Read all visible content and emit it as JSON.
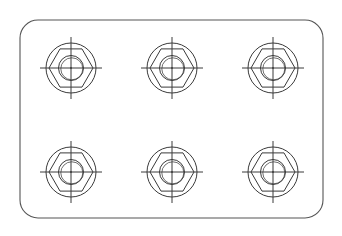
{
  "drawing": {
    "background": "#ffffff",
    "line_color": "#3a3a3a",
    "frame": {
      "x": 20,
      "y": 20,
      "width": 303,
      "height": 198,
      "corner_radius": 18
    },
    "bolt_pattern": {
      "rows": 2,
      "cols": 3,
      "col_x": [
        71,
        172,
        273
      ],
      "row_y": [
        68,
        172
      ],
      "outer_circle_radius": 25,
      "hex_vertex_radius": 22,
      "inner_circle_radius": 11,
      "inner_circle2_radius": 12.5,
      "crosshair_half_length": 31,
      "count": 6
    }
  }
}
